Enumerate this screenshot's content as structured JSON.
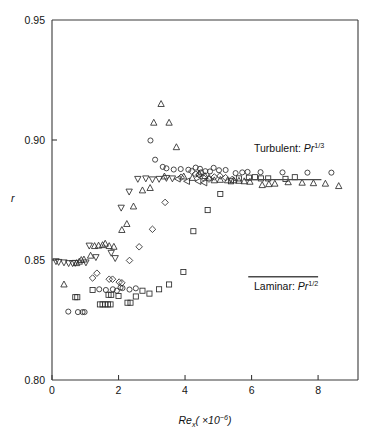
{
  "chart_data": {
    "type": "scatter",
    "title": "",
    "xlabel": "Re_x (×10⁻⁶)",
    "ylabel": "r",
    "xlim": [
      0,
      9.2
    ],
    "ylim": [
      0.8,
      0.95
    ],
    "xticks": [
      0,
      2,
      4,
      6,
      8
    ],
    "xticklabels": [
      "0",
      "2",
      "4",
      "6",
      "8"
    ],
    "yticks": [
      0.8,
      0.85,
      0.9,
      0.95
    ],
    "yticklabels": [
      "0.80",
      "0.85",
      "0.90",
      "0.95"
    ],
    "grid": false,
    "legend": "none",
    "series": [
      {
        "name": "circle",
        "marker": "circle",
        "points": [
          [
            0.49,
            0.8285
          ],
          [
            0.78,
            0.8283
          ],
          [
            0.92,
            0.8283
          ],
          [
            0.98,
            0.8283
          ],
          [
            1.42,
            0.8378
          ],
          [
            1.62,
            0.8375
          ],
          [
            1.83,
            0.8378
          ],
          [
            1.95,
            0.8372
          ],
          [
            2.06,
            0.8385
          ],
          [
            2.12,
            0.8383
          ],
          [
            2.33,
            0.8377
          ],
          [
            2.52,
            0.8382
          ],
          [
            2.96,
            0.8998
          ],
          [
            3.1,
            0.8918
          ],
          [
            3.33,
            0.8888
          ],
          [
            3.44,
            0.8882
          ],
          [
            3.66,
            0.8877
          ],
          [
            3.87,
            0.8879
          ],
          [
            4.1,
            0.8876
          ],
          [
            4.32,
            0.8885
          ],
          [
            4.45,
            0.888
          ],
          [
            4.48,
            0.8865
          ],
          [
            4.61,
            0.887
          ],
          [
            4.75,
            0.8869
          ],
          [
            4.86,
            0.8884
          ],
          [
            5.02,
            0.8874
          ],
          [
            5.22,
            0.8875
          ],
          [
            5.52,
            0.8862
          ],
          [
            5.72,
            0.8865
          ],
          [
            5.88,
            0.8867
          ],
          [
            6.27,
            0.8866
          ],
          [
            6.93,
            0.8865
          ],
          [
            7.68,
            0.8864
          ],
          [
            8.4,
            0.8864
          ]
        ]
      },
      {
        "name": "square",
        "marker": "square",
        "points": [
          [
            0.7,
            0.8345
          ],
          [
            0.76,
            0.8345
          ],
          [
            1.22,
            0.8375
          ],
          [
            1.44,
            0.8315
          ],
          [
            1.52,
            0.8315
          ],
          [
            1.6,
            0.8315
          ],
          [
            1.68,
            0.8315
          ],
          [
            1.76,
            0.8315
          ],
          [
            1.7,
            0.8355
          ],
          [
            1.78,
            0.8355
          ],
          [
            2.0,
            0.835
          ],
          [
            2.27,
            0.8322
          ],
          [
            2.36,
            0.8322
          ],
          [
            2.52,
            0.8348
          ],
          [
            2.72,
            0.8372
          ],
          [
            2.93,
            0.836
          ],
          [
            3.22,
            0.8378
          ],
          [
            3.52,
            0.8398
          ],
          [
            3.95,
            0.845
          ],
          [
            4.25,
            0.862
          ],
          [
            4.68,
            0.8708
          ],
          [
            5.06,
            0.8775
          ],
          [
            5.38,
            0.8828
          ],
          [
            5.62,
            0.884
          ],
          [
            5.92,
            0.8843
          ],
          [
            6.1,
            0.8845
          ],
          [
            6.28,
            0.884
          ],
          [
            6.5,
            0.884
          ],
          [
            7.02,
            0.8838
          ],
          [
            7.3,
            0.8845
          ]
        ]
      },
      {
        "name": "diamond",
        "marker": "diamond",
        "points": [
          [
            1.22,
            0.8425
          ],
          [
            1.35,
            0.8445
          ],
          [
            1.72,
            0.842
          ],
          [
            1.82,
            0.842
          ],
          [
            2.02,
            0.8408
          ],
          [
            2.1,
            0.8405
          ],
          [
            2.33,
            0.8498
          ],
          [
            2.62,
            0.8555
          ],
          [
            3.02,
            0.8628
          ],
          [
            3.4,
            0.874
          ],
          [
            3.88,
            0.8845
          ],
          [
            4.2,
            0.887
          ],
          [
            4.32,
            0.8858
          ],
          [
            4.42,
            0.8855
          ],
          [
            4.55,
            0.8843
          ],
          [
            4.72,
            0.8837
          ],
          [
            4.88,
            0.8846
          ],
          [
            5.05,
            0.885
          ],
          [
            5.22,
            0.8843
          ],
          [
            5.42,
            0.8836
          ]
        ]
      },
      {
        "name": "triangle-up",
        "marker": "triangle-up",
        "points": [
          [
            0.36,
            0.8398
          ],
          [
            0.74,
            0.8487
          ],
          [
            0.82,
            0.8493
          ],
          [
            0.88,
            0.85
          ],
          [
            0.96,
            0.8502
          ],
          [
            1.16,
            0.8518
          ],
          [
            1.28,
            0.8558
          ],
          [
            1.4,
            0.856
          ],
          [
            1.52,
            0.8562
          ],
          [
            1.6,
            0.8568
          ],
          [
            1.72,
            0.8558
          ],
          [
            1.86,
            0.8555
          ],
          [
            2.1,
            0.8625
          ],
          [
            2.25,
            0.865
          ],
          [
            2.45,
            0.8723
          ],
          [
            2.72,
            0.879
          ],
          [
            2.95,
            0.88
          ],
          [
            3.06,
            0.9072
          ],
          [
            3.28,
            0.915
          ],
          [
            3.52,
            0.9072
          ],
          [
            3.38,
            0.8848
          ],
          [
            3.74,
            0.897
          ],
          [
            3.96,
            0.8848
          ],
          [
            4.22,
            0.8842
          ],
          [
            4.42,
            0.886
          ],
          [
            4.6,
            0.885
          ],
          [
            4.72,
            0.8843
          ],
          [
            4.88,
            0.8832
          ],
          [
            5.06,
            0.8834
          ],
          [
            5.28,
            0.8832
          ],
          [
            5.46,
            0.8832
          ],
          [
            5.62,
            0.883
          ],
          [
            5.78,
            0.8828
          ],
          [
            5.95,
            0.8826
          ],
          [
            6.32,
            0.8812
          ],
          [
            6.52,
            0.8816
          ],
          [
            6.7,
            0.8818
          ],
          [
            7.1,
            0.8824
          ],
          [
            7.52,
            0.8822
          ],
          [
            7.86,
            0.882
          ],
          [
            8.22,
            0.8818
          ],
          [
            8.62,
            0.8808
          ]
        ]
      },
      {
        "name": "triangle-down",
        "marker": "triangle-down",
        "points": [
          [
            0.12,
            0.8495
          ],
          [
            0.2,
            0.8492
          ],
          [
            0.36,
            0.849
          ],
          [
            0.5,
            0.8487
          ],
          [
            0.62,
            0.8487
          ],
          [
            0.7,
            0.8488
          ],
          [
            1.02,
            0.849
          ],
          [
            1.12,
            0.856
          ],
          [
            1.32,
            0.8512
          ],
          [
            1.78,
            0.853
          ],
          [
            1.9,
            0.8508
          ],
          [
            2.08,
            0.8718
          ],
          [
            2.32,
            0.8785
          ],
          [
            2.58,
            0.8838
          ],
          [
            2.82,
            0.884
          ],
          [
            3.02,
            0.8836
          ],
          [
            3.22,
            0.8838
          ],
          [
            3.44,
            0.8842
          ],
          [
            3.62,
            0.884
          ]
        ]
      },
      {
        "name": "triangle-left",
        "marker": "triangle-left",
        "points": [
          [
            3.78,
            0.8838
          ],
          [
            4.06,
            0.8828
          ],
          [
            4.4,
            0.8828
          ],
          [
            4.58,
            0.8822
          ]
        ]
      }
    ],
    "annotations": [
      {
        "id": "turbulent",
        "text": "Turbulent:",
        "symbol": "Pr",
        "exponent": "1/3",
        "line_y": 0.8835,
        "line_x_start": 5.78,
        "line_x_end": 8.1
      },
      {
        "id": "laminar",
        "text": "Laminar:",
        "symbol": "Pr",
        "exponent": "1/2",
        "line_y": 0.843,
        "line_x_start": 5.9,
        "line_x_end": 8.0
      }
    ],
    "axis_title_x": {
      "symbol": "Re",
      "sub": "x",
      "rest": "( ×10",
      "exp": "−6",
      "close": ")"
    },
    "axis_title_y": "r"
  },
  "colors": {
    "axis": "#3a3a3a",
    "marker": "#2b2b2b",
    "annotation_line": "#4a4a4a",
    "text": "#111111",
    "background": "#ffffff"
  }
}
